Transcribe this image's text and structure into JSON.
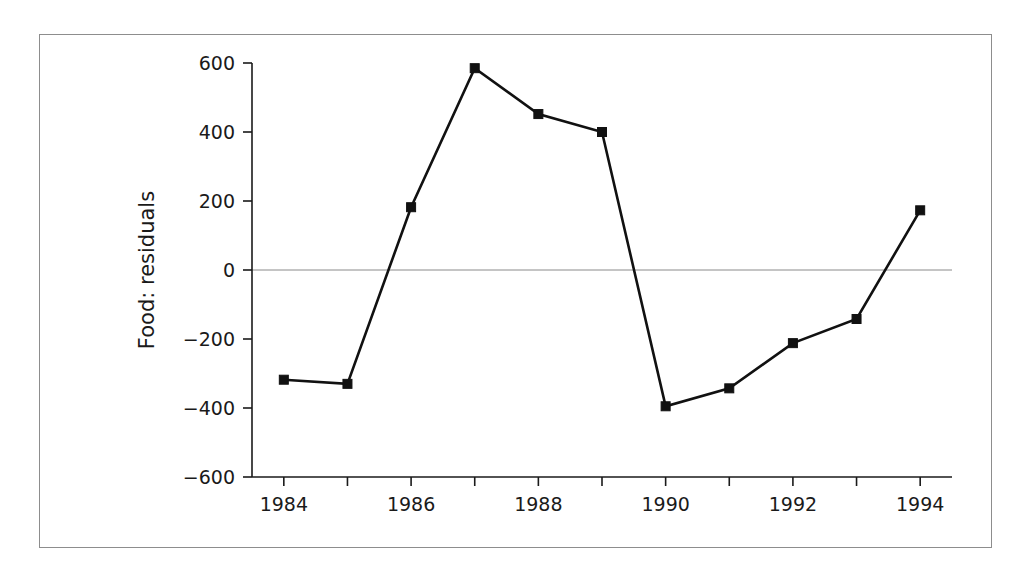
{
  "figure": {
    "frame_color": "#8d8d8d",
    "background": "#ffffff"
  },
  "chart_data": {
    "type": "line",
    "title": "",
    "subtitle": "",
    "xlabel": "",
    "ylabel": "Food: residuals",
    "x": [
      1984,
      1985,
      1986,
      1987,
      1988,
      1989,
      1990,
      1991,
      1992,
      1993,
      1994
    ],
    "values": [
      -318,
      -330,
      182,
      585,
      452,
      400,
      -395,
      -343,
      -212,
      -142,
      173
    ],
    "series": [
      {
        "name": "Food: residuals",
        "values": [
          -318,
          -330,
          182,
          585,
          452,
          400,
          -395,
          -343,
          -212,
          -142,
          173
        ],
        "color": "#111111",
        "marker": "square",
        "marker_size": 9
      }
    ],
    "xlim": [
      1983.5,
      1994.5
    ],
    "ylim": [
      -600,
      600
    ],
    "yticks": [
      -600,
      -400,
      -200,
      0,
      200,
      400,
      600
    ],
    "ytick_labels": [
      "−600",
      "−400",
      "−200",
      "0",
      "200",
      "400",
      "600"
    ],
    "xticks": [
      1984,
      1985,
      1986,
      1987,
      1988,
      1989,
      1990,
      1991,
      1992,
      1993,
      1994
    ],
    "xtick_labels": [
      "1984",
      "",
      "1986",
      "",
      "1988",
      "",
      "1990",
      "",
      "1992",
      "",
      "1994"
    ],
    "grid": false,
    "zero_reference_line": {
      "value": 0,
      "color": "#8a8a8a",
      "visible": true
    },
    "legend": {
      "visible": false,
      "position": "none"
    },
    "annotations": []
  }
}
